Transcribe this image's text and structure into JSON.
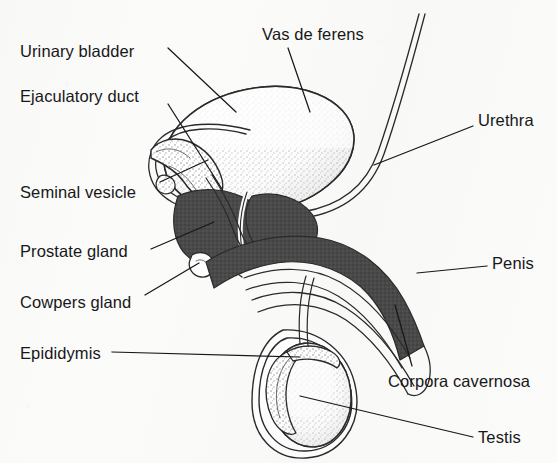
{
  "figure": {
    "kind": "labeled anatomical line drawing",
    "background_color": "#fbfbf9",
    "ink_color": "#17171a",
    "fill_dark_color": "#4a4a4a",
    "fill_stipple_color": "#8a8a8a"
  },
  "labels": [
    {
      "id": "urinary-bladder",
      "text": "Urinary bladder",
      "x": 20,
      "y": 43,
      "leader": {
        "x1": 168,
        "y1": 48,
        "x2": 236,
        "y2": 112
      }
    },
    {
      "id": "ejaculatory-duct",
      "text": "Ejaculatory duct",
      "x": 20,
      "y": 88,
      "leader": {
        "x1": 168,
        "y1": 104,
        "x2": 222,
        "y2": 189
      }
    },
    {
      "id": "vas-de-ferens",
      "text": "Vas de ferens",
      "x": 262,
      "y": 26,
      "leader": {
        "x1": 288,
        "y1": 48,
        "x2": 310,
        "y2": 112
      }
    },
    {
      "id": "urethra",
      "text": "Urethra",
      "x": 478,
      "y": 112,
      "leader": {
        "x1": 473,
        "y1": 126,
        "x2": 374,
        "y2": 165
      }
    },
    {
      "id": "seminal-vesicle",
      "text": "Seminal vesicle",
      "x": 20,
      "y": 184,
      "leader": {
        "x1": 160,
        "y1": 182,
        "x2": 208,
        "y2": 160
      }
    },
    {
      "id": "prostate-gland",
      "text": "Prostate gland",
      "x": 20,
      "y": 243,
      "leader": {
        "x1": 151,
        "y1": 249,
        "x2": 214,
        "y2": 222
      }
    },
    {
      "id": "penis",
      "text": "Penis",
      "x": 492,
      "y": 255,
      "leader": {
        "x1": 487,
        "y1": 266,
        "x2": 417,
        "y2": 273
      }
    },
    {
      "id": "cowpers-gland",
      "text": "Cowpers gland",
      "x": 20,
      "y": 294,
      "leader": {
        "x1": 145,
        "y1": 295,
        "x2": 199,
        "y2": 263
      }
    },
    {
      "id": "epididymis",
      "text": "Epididymis",
      "x": 20,
      "y": 345,
      "leader": {
        "x1": 112,
        "y1": 352,
        "x2": 300,
        "y2": 357
      }
    },
    {
      "id": "corpora-cavernosa",
      "text": "Corpora cavernosa",
      "x": 388,
      "y": 373,
      "leader": {
        "x1": 412,
        "y1": 366,
        "x2": 395,
        "y2": 305
      }
    },
    {
      "id": "testis",
      "text": "Testis",
      "x": 478,
      "y": 429,
      "leader": {
        "x1": 473,
        "y1": 437,
        "x2": 300,
        "y2": 396
      }
    }
  ],
  "structures": [
    {
      "id": "urinary-bladder",
      "shape": "stippled oval sac",
      "fill": "stipple"
    },
    {
      "id": "seminal-vesicle",
      "shape": "finger-like lobe",
      "fill": "stipple"
    },
    {
      "id": "prostate-gland",
      "shape": "rounded mass below bladder",
      "fill": "dark"
    },
    {
      "id": "corpora-cavernosa",
      "shape": "curved shaft band",
      "fill": "dark"
    },
    {
      "id": "vas-de-ferens",
      "shape": "paired thin duct lines",
      "fill": "none"
    },
    {
      "id": "urethra",
      "shape": "narrow channel through shaft",
      "fill": "none"
    },
    {
      "id": "cowpers-gland",
      "shape": "small bulb",
      "fill": "none"
    },
    {
      "id": "testis",
      "shape": "oval in scrotum",
      "fill": "stipple"
    },
    {
      "id": "epididymis",
      "shape": "crescent along testis",
      "fill": "stipple"
    },
    {
      "id": "penis",
      "shape": "shaft outline",
      "fill": "none"
    }
  ]
}
